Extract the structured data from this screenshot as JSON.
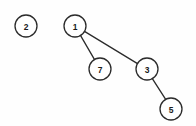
{
  "diagram": {
    "background_color": "#fefefe",
    "stroke_color": "#2b2b2b",
    "label_color": "#1a1a1a",
    "node_fill": "#ffffff",
    "node_radius": 11,
    "width": 196,
    "height": 126,
    "nodes": [
      {
        "id": "n2",
        "label": "2",
        "cx": 26,
        "cy": 26,
        "r": 11
      },
      {
        "id": "n1",
        "label": "1",
        "cx": 75,
        "cy": 26,
        "r": 11
      },
      {
        "id": "n7",
        "label": "7",
        "cx": 100,
        "cy": 69,
        "r": 11
      },
      {
        "id": "n3",
        "label": "3",
        "cx": 147,
        "cy": 69,
        "r": 11
      },
      {
        "id": "n5",
        "label": "5",
        "cx": 171,
        "cy": 109,
        "r": 11
      }
    ],
    "edges": [
      {
        "id": "e1",
        "from": "n1",
        "to": "n7",
        "x1": 80.6,
        "y1": 35.6,
        "x2": 94.4,
        "y2": 59.4
      },
      {
        "id": "e2",
        "from": "n1",
        "to": "n3",
        "x1": 84.5,
        "y1": 31.4,
        "x2": 137.5,
        "y2": 63.6
      },
      {
        "id": "e3",
        "from": "n3",
        "to": "n5",
        "x1": 152.5,
        "y1": 78.8,
        "x2": 165.5,
        "y2": 99.2
      }
    ]
  },
  "chart_data": {
    "type": "diagram",
    "subtype": "node-link-tree",
    "node_labels": [
      "2",
      "1",
      "7",
      "3",
      "5"
    ],
    "node_positions": [
      [
        26,
        26
      ],
      [
        75,
        26
      ],
      [
        100,
        69
      ],
      [
        147,
        69
      ],
      [
        171,
        109
      ]
    ],
    "edge_list": [
      [
        "1",
        "7"
      ],
      [
        "1",
        "3"
      ],
      [
        "3",
        "5"
      ]
    ],
    "isolated_nodes": [
      "2"
    ],
    "root": "1",
    "legend": "none",
    "grid": false
  }
}
